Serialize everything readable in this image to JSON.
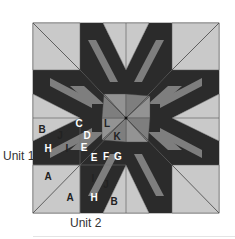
{
  "figure": {
    "type": "quilt-block-piecing-diagram",
    "colors": {
      "background_light": "#c9c9c9",
      "medium": "#7e7e7e",
      "medium_alt": "#939393",
      "dark": "#2b2b2b",
      "outline": "#555555",
      "label_light": "#ffffff",
      "label_dark": "#222222"
    },
    "unit_labels": {
      "unit1": "Unit 1",
      "unit2": "Unit 2"
    },
    "piece_labels": [
      {
        "text": "B",
        "x": 42,
        "y": 133,
        "color": "label_dark"
      },
      {
        "text": "C",
        "x": 79,
        "y": 127,
        "color": "label_light"
      },
      {
        "text": "L",
        "x": 107,
        "y": 127,
        "color": "label_dark"
      },
      {
        "text": "J",
        "x": 60,
        "y": 139,
        "color": "label_dark"
      },
      {
        "text": "D",
        "x": 87,
        "y": 139,
        "color": "label_light"
      },
      {
        "text": "K",
        "x": 117,
        "y": 140,
        "color": "label_dark"
      },
      {
        "text": "H",
        "x": 48,
        "y": 152,
        "color": "label_light"
      },
      {
        "text": "I",
        "x": 67,
        "y": 152,
        "color": "label_dark"
      },
      {
        "text": "E",
        "x": 84,
        "y": 151,
        "color": "label_light"
      },
      {
        "text": "E",
        "x": 94,
        "y": 161,
        "color": "label_light"
      },
      {
        "text": "F",
        "x": 106,
        "y": 160,
        "color": "label_light"
      },
      {
        "text": "G",
        "x": 118,
        "y": 160,
        "color": "label_light"
      },
      {
        "text": "A",
        "x": 48,
        "y": 180,
        "color": "label_dark"
      },
      {
        "text": "I",
        "x": 93,
        "y": 182,
        "color": "label_dark"
      },
      {
        "text": "J",
        "x": 106,
        "y": 188,
        "color": "label_dark"
      },
      {
        "text": "A",
        "x": 70,
        "y": 201,
        "color": "label_dark"
      },
      {
        "text": "H",
        "x": 94,
        "y": 201,
        "color": "label_light"
      },
      {
        "text": "B",
        "x": 114,
        "y": 205,
        "color": "label_dark"
      }
    ]
  }
}
